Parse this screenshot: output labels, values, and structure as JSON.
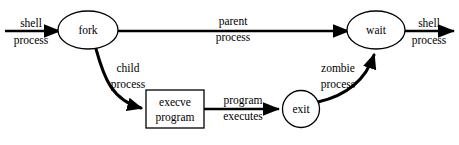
{
  "diagram": {
    "background_color": "#ffffff",
    "stroke_color": "#000000",
    "nodes": [
      {
        "id": "fork",
        "shape": "ellipse",
        "label": "fork",
        "label_line1": "fork",
        "label_line2": "",
        "cx": 88,
        "cy": 30,
        "rx": 30,
        "ry": 19
      },
      {
        "id": "wait",
        "shape": "ellipse",
        "label": "wait",
        "label_line1": "wait",
        "label_line2": "",
        "cx": 376,
        "cy": 30,
        "rx": 29,
        "ry": 19
      },
      {
        "id": "execve",
        "shape": "rectangle",
        "label": "execve program",
        "label_line1": "execve",
        "label_line2": "program",
        "x": 146,
        "y": 90,
        "w": 58,
        "h": 38
      },
      {
        "id": "exit",
        "shape": "circle",
        "label": "exit",
        "label_line1": "exit",
        "label_line2": "",
        "cx": 301,
        "cy": 109,
        "r": 18.5
      }
    ],
    "edges": [
      {
        "id": "shell-in",
        "from": "",
        "to": "fork",
        "label_line1": "shell",
        "label_line2": "process",
        "label_x": 31,
        "label_y_top": 27,
        "label_y_bottom": 44,
        "style": "straight-arrow"
      },
      {
        "id": "parent-process",
        "from": "fork",
        "to": "wait",
        "label_line1": "parent",
        "label_line2": "process",
        "label_x": 233,
        "label_y_top": 25,
        "label_y_bottom": 41,
        "style": "straight-arrow"
      },
      {
        "id": "shell-out",
        "from": "wait",
        "to": "",
        "label_line1": "shell",
        "label_line2": "process",
        "label_x": 429,
        "label_y_top": 27,
        "label_y_bottom": 44,
        "style": "straight-arrow"
      },
      {
        "id": "child-process",
        "from": "fork",
        "to": "execve",
        "label_line1": "child",
        "label_line2": "process",
        "label_x": 128,
        "label_y_top": 72,
        "label_y_bottom": 88,
        "style": "curved-arrow"
      },
      {
        "id": "program-executes",
        "from": "execve",
        "to": "exit",
        "label_line1": "program",
        "label_line2": "executes",
        "label_x": 243,
        "label_y_top": 104,
        "label_y_bottom": 120,
        "style": "straight-arrow"
      },
      {
        "id": "zombie-process",
        "from": "exit",
        "to": "wait",
        "label_line1": "zombie",
        "label_line2": "process",
        "label_x": 338,
        "label_y_top": 72,
        "label_y_bottom": 88,
        "style": "curved-arrow"
      }
    ]
  }
}
